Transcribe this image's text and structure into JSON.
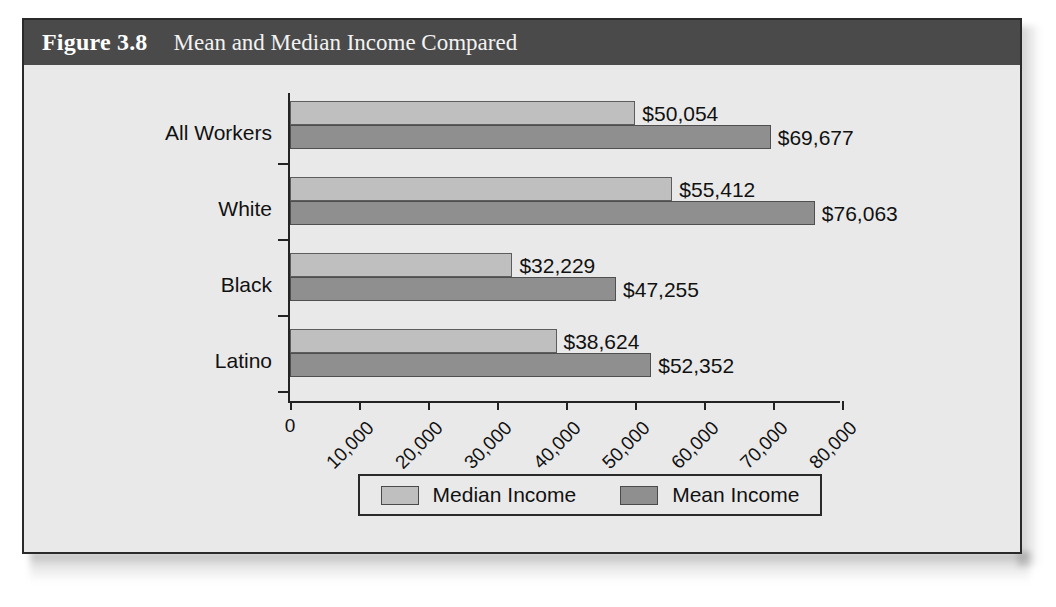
{
  "figure": {
    "number": "Figure 3.8",
    "title": "Mean and Median Income Compared"
  },
  "legend": {
    "median_label": "Median Income",
    "mean_label": "Mean Income"
  },
  "colors": {
    "median_bar": "#bfbfbf",
    "mean_bar": "#8f8f8f",
    "title_bar": "#4a4a4a",
    "panel_background": "#e9e9e9",
    "axis": "#232323"
  },
  "chart_data": {
    "type": "bar",
    "orientation": "horizontal",
    "title": "Mean and Median Income Compared",
    "xlabel": "",
    "ylabel": "",
    "xlim": [
      0,
      80000
    ],
    "grid": false,
    "legend_position": "bottom",
    "categories": [
      "All Workers",
      "White",
      "Black",
      "Latino"
    ],
    "xticks": [
      0,
      10000,
      20000,
      30000,
      40000,
      50000,
      60000,
      70000,
      80000
    ],
    "xtick_labels": [
      "0",
      "10,000",
      "20,000",
      "30,000",
      "40,000",
      "50,000",
      "60,000",
      "70,000",
      "80,000"
    ],
    "series": [
      {
        "name": "Median Income",
        "values": [
          50054,
          55412,
          32229,
          38624
        ],
        "labels": [
          "$50,054",
          "$55,412",
          "$32,229",
          "$38,624"
        ]
      },
      {
        "name": "Mean Income",
        "values": [
          69677,
          76063,
          47255,
          52352
        ],
        "labels": [
          "$69,677",
          "$76,063",
          "$47,255",
          "$52,352"
        ]
      }
    ]
  }
}
